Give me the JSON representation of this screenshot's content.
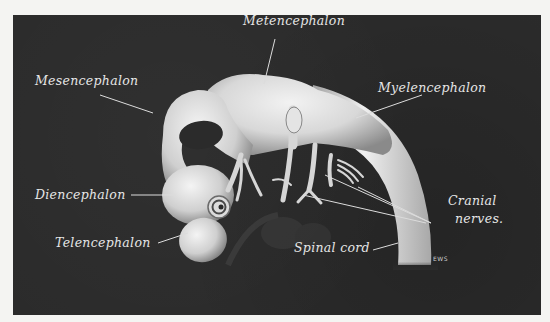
{
  "figure": {
    "background_color": "#2b2b2b",
    "page_color": "#f4f4f2",
    "label_color": "#e6e6e6"
  },
  "labels": {
    "metencephalon": "Metencephalon",
    "mesencephalon": "Mesencephalon",
    "myelencephalon": "Myelencephalon",
    "diencephalon": "Diencephalon",
    "telencephalon": "Telencephalon",
    "cranial_nerves_line1": "Cranial",
    "cranial_nerves_line2": "nerves.",
    "spinal_cord": "Spinal cord"
  },
  "signature": "EWS"
}
